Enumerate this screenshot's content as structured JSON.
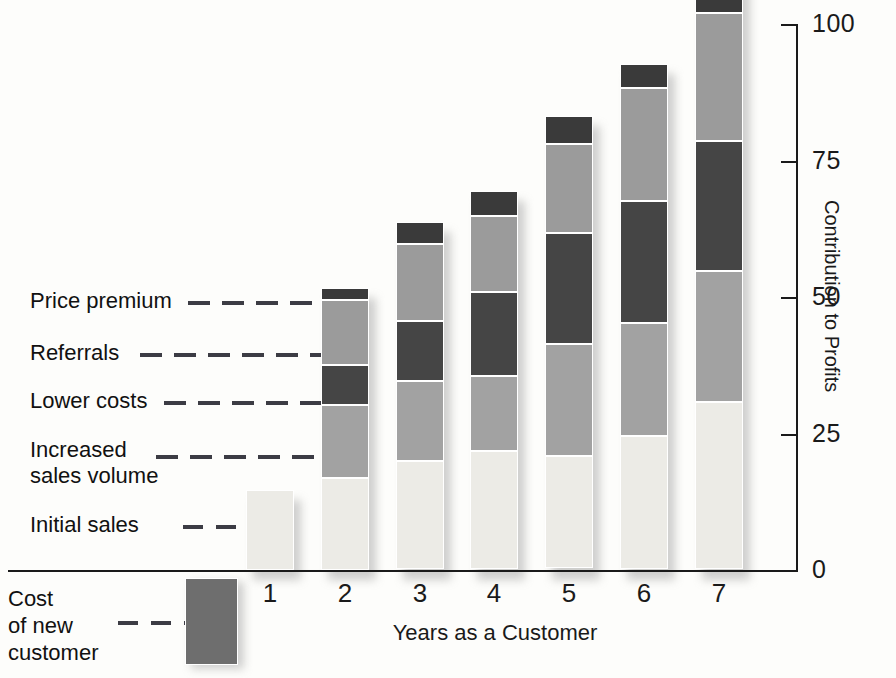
{
  "chart_data": {
    "type": "bar",
    "subtype": "stacked",
    "title": "",
    "xlabel": "Years as a Customer",
    "ylabel": "Contribution to Profits",
    "categories": [
      "0",
      "1",
      "2",
      "3",
      "4",
      "5",
      "6",
      "7"
    ],
    "ylim": [
      0,
      100
    ],
    "yticks": [
      0,
      25,
      50,
      75,
      100
    ],
    "ytick_labels": [
      "0",
      "25",
      "50",
      "75",
      "100"
    ],
    "grid": false,
    "legend_position": "left-inline-callouts",
    "series": [
      {
        "name": "Initial sales",
        "color": "#ecebe6",
        "values": [
          0,
          14.7,
          16.9,
          19.8,
          21.7,
          20.6,
          24.4,
          30.6
        ]
      },
      {
        "name": "Increased sales volume",
        "color": "#a2a2a2",
        "values": [
          0,
          0,
          13.4,
          14.7,
          13.8,
          20.6,
          20.7,
          24.0
        ]
      },
      {
        "name": "Lower costs",
        "color": "#454545",
        "values": [
          0,
          0,
          7.3,
          11.0,
          15.4,
          20.4,
          22.4,
          23.9
        ]
      },
      {
        "name": "Referrals",
        "color": "#9b9b9b",
        "values": [
          0,
          0,
          11.9,
          14.1,
          13.9,
          16.3,
          20.7,
          23.5
        ]
      },
      {
        "name": "Price premium",
        "color": "#3a3a3a",
        "values": [
          0,
          0,
          2.2,
          4.1,
          4.6,
          5.2,
          4.4,
          6.0
        ]
      },
      {
        "name": "Cost of new customer",
        "color": "#6e6e6e",
        "values": [
          -16.0,
          0,
          0,
          0,
          0,
          0,
          0,
          0
        ]
      }
    ],
    "totals": [
      -16.0,
      14.7,
      51.7,
      63.7,
      69.4,
      83.1,
      92.6,
      108.0
    ]
  },
  "axes": {
    "y_title": "Contribution to Profits",
    "x_title": "Years as a Customer",
    "y_ticks": [
      "100",
      "75",
      "50",
      "25",
      "0"
    ],
    "x_ticks": [
      "0",
      "1",
      "2",
      "3",
      "4",
      "5",
      "6",
      "7"
    ]
  },
  "callouts": [
    {
      "id": "price-premium",
      "label": "Price premium"
    },
    {
      "id": "referrals",
      "label": "Referrals"
    },
    {
      "id": "lower-costs",
      "label": "Lower costs"
    },
    {
      "id": "increased-sales",
      "label": "Increased\nsales volume"
    },
    {
      "id": "initial-sales",
      "label": "Initial sales"
    },
    {
      "id": "cost-new",
      "label": "Cost\nof new\ncustomer"
    }
  ],
  "cost_bar": {
    "value_label": "0"
  },
  "colors": {
    "price_premium": "#3a3a3a",
    "referrals": "#9b9b9b",
    "lower_costs": "#454545",
    "increased_sales_volume": "#a2a2a2",
    "initial_sales": "#ecebe6",
    "cost_of_new_customer": "#6e6e6e",
    "axis": "#1a1a1a",
    "leader": "#3c3c44"
  }
}
